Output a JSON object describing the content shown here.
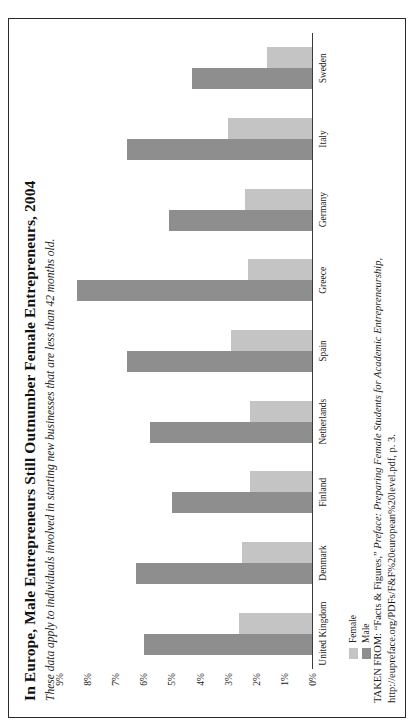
{
  "figure": {
    "title": "In Europe, Male Entrepreneurs Still Outnumber Female Entrepreneurs, 2004",
    "subtitle": "These data apply to individuals involved in starting new businesses that are less than 42 months old.",
    "source_prefix": "TAKEN FROM: “Facts & Figures,” ",
    "source_italic": "Preface: Preparing Female Students for Academic Entrepreneurship,",
    "source_suffix": " http://eupreface.org/PDFs/F&F%20european%20level.pdf, p. 3."
  },
  "legend": {
    "female_label": "Female",
    "male_label": "Male",
    "female_color": "#c4c4c4",
    "male_color": "#8e8e8e",
    "position": "bottom-left"
  },
  "chart_data": {
    "type": "bar",
    "title": "In Europe, Male Entrepreneurs Still Outnumber Female Entrepreneurs, 2004",
    "subtitle": "These data apply to individuals involved in starting new businesses that are less than 42 months old.",
    "xlabel": "",
    "ylabel": "",
    "ylim": [
      0,
      9
    ],
    "grid": false,
    "orientation": "vertical",
    "categories": [
      "United Kingdom",
      "Denmark",
      "Finland",
      "Netherlands",
      "Spain",
      "Greece",
      "Germany",
      "Italy",
      "Sweden"
    ],
    "tick_labels": [
      "9%",
      "8%",
      "7%",
      "6%",
      "5%",
      "4%",
      "3%",
      "2%",
      "1%",
      "0%"
    ],
    "tick_values": [
      9,
      8,
      7,
      6,
      5,
      4,
      3,
      2,
      1,
      0
    ],
    "series": [
      {
        "name": "Male",
        "color": "#8e8e8e",
        "values": [
          6.0,
          6.3,
          5.0,
          5.8,
          6.6,
          8.4,
          5.1,
          6.6,
          4.3
        ]
      },
      {
        "name": "Female",
        "color": "#c4c4c4",
        "values": [
          2.6,
          2.5,
          2.2,
          2.2,
          2.9,
          2.3,
          2.4,
          3.0,
          1.6
        ]
      }
    ]
  }
}
